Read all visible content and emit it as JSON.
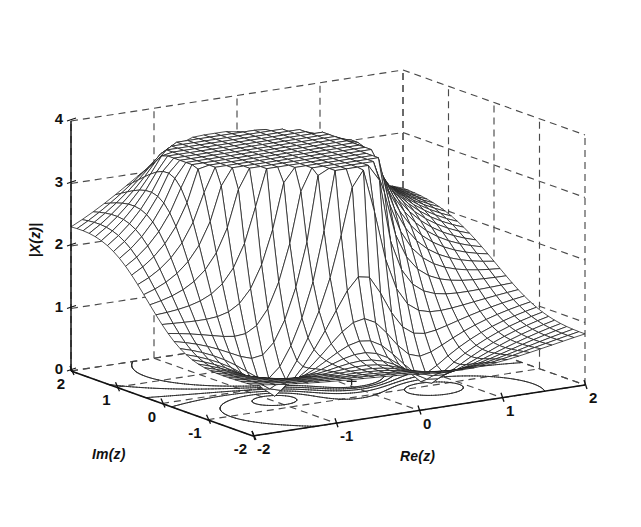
{
  "figure": {
    "kind": "matlab-3d-mesh-surface",
    "background": "#ffffff",
    "line_color": "#1a1a1a",
    "grid_color": "#5a5a5a",
    "axis_color": "#111111"
  },
  "axes": {
    "z": {
      "label": "|X(z)|",
      "ticks": [
        "0",
        "1",
        "2",
        "3",
        "4"
      ],
      "values": [
        0,
        1,
        2,
        3,
        4
      ],
      "range": [
        0,
        4
      ]
    },
    "im": {
      "label": "Im(z)",
      "ticks": [
        "2",
        "1",
        "0",
        "-1",
        "-2"
      ],
      "values": [
        2,
        1,
        0,
        -1,
        -2
      ],
      "range": [
        -2,
        2
      ]
    },
    "re": {
      "label": "Re(z)",
      "ticks": [
        "-2",
        "-1",
        "0",
        "1",
        "2"
      ],
      "values": [
        -2,
        -1,
        0,
        1,
        2
      ],
      "range": [
        -2,
        2
      ]
    }
  },
  "chart_data": {
    "type": "surface",
    "title": "",
    "xlabel": "Re(z)",
    "ylabel": "Im(z)",
    "zlabel": "|X(z)|",
    "xlim": [
      -2,
      2
    ],
    "ylim": [
      -2,
      2
    ],
    "zlim": [
      0,
      4
    ],
    "grid": true,
    "legend": null,
    "mesh": {
      "nx": 29,
      "ny": 29,
      "style": "wireframe-hidden-line"
    },
    "surface_function": "magnitude of z-transform |X(z)| with two conjugate poles and two conjugate zeros",
    "poles": [
      {
        "re": -0.45,
        "im": 0.62,
        "peak_z": 3.35
      },
      {
        "re": 0.12,
        "im": -0.3,
        "peak_z": 3.3
      }
    ],
    "zeros": [
      {
        "re": -0.95,
        "im": -0.55,
        "z": 0.0
      },
      {
        "re": 0.62,
        "im": -1.05,
        "z": 0.0
      }
    ],
    "base_contour": {
      "enabled": true,
      "plane_z": 0,
      "levels": [
        0.35,
        0.7,
        1.1,
        1.6,
        2.2,
        2.9
      ],
      "pole_markers": "+"
    },
    "surface_extrema": {
      "max_z": 3.4,
      "min_z": 0.0
    },
    "view": {
      "azimuth": -37.5,
      "elevation": 30
    }
  }
}
